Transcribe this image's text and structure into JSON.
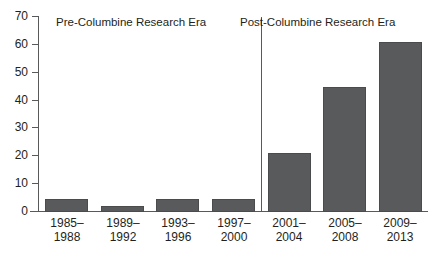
{
  "chart_data": {
    "type": "bar",
    "title": "PUBLICATIONS PER ERA",
    "xlabel": "",
    "ylabel": "",
    "ylim": [
      0,
      70
    ],
    "yticks": [
      0,
      10,
      20,
      30,
      40,
      50,
      60,
      70
    ],
    "grid": false,
    "legend_position": "none",
    "categories": [
      "1985–1988",
      "1989–1992",
      "1993–1996",
      "1997–2000",
      "2001–2004",
      "2005–2008",
      "2009–2013"
    ],
    "category_lines": [
      [
        "1985–",
        "1988"
      ],
      [
        "1989–",
        "1992"
      ],
      [
        "1993–",
        "1996"
      ],
      [
        "1997–",
        "2000"
      ],
      [
        "2001–",
        "2004"
      ],
      [
        "2005–",
        "2008"
      ],
      [
        "2009–",
        "2013"
      ]
    ],
    "values": [
      4.5,
      2,
      4.5,
      4.5,
      21,
      45,
      61
    ],
    "bar_color": "#595a5c",
    "axis_color": "#58595b",
    "annotations": [
      {
        "name": "pre-columbine-era",
        "text": "Pre-Columbine Research Era"
      },
      {
        "name": "post-columbine-era",
        "text": "Post-Columbine Research Era"
      }
    ],
    "divider": {
      "name": "era-divider",
      "between_categories": [
        "1997–2000",
        "2001–2004"
      ]
    }
  },
  "ytick_labels": [
    "0",
    "10",
    "20",
    "30",
    "40",
    "50",
    "60",
    "70"
  ]
}
